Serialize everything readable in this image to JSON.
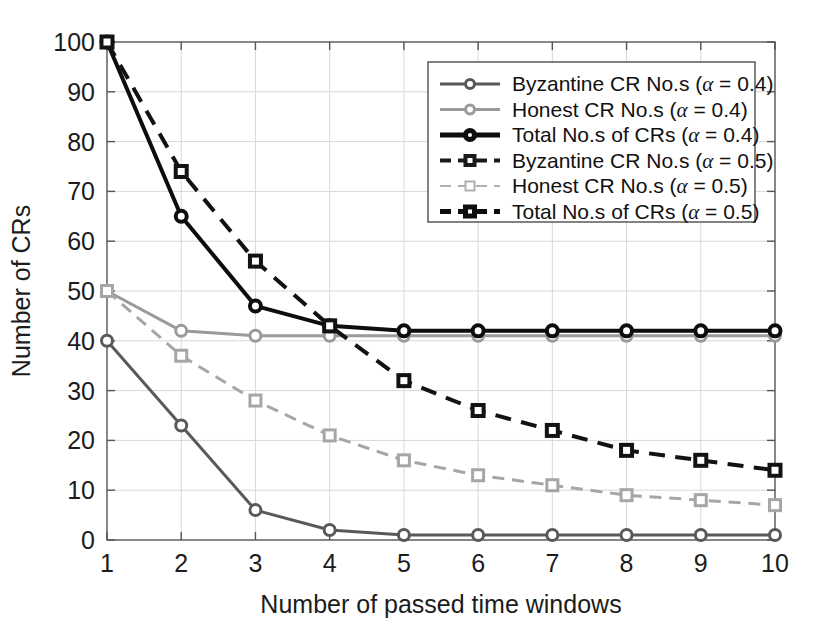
{
  "chart_data": {
    "type": "line",
    "title": "",
    "xlabel": "Number of passed time windows",
    "ylabel": "Number of CRs",
    "x": [
      1,
      2,
      3,
      4,
      5,
      6,
      7,
      8,
      9,
      10
    ],
    "xtick_labels": [
      "1",
      "2",
      "3",
      "4",
      "5",
      "6",
      "7",
      "8",
      "9",
      "10"
    ],
    "ytick_labels": [
      "0",
      "10",
      "20",
      "30",
      "40",
      "50",
      "60",
      "70",
      "80",
      "90",
      "100"
    ],
    "yticks": [
      0,
      10,
      20,
      30,
      40,
      50,
      60,
      70,
      80,
      90,
      100
    ],
    "xlim": [
      1,
      10
    ],
    "ylim": [
      0,
      100
    ],
    "grid": true,
    "legend_position": "upper right",
    "series": [
      {
        "name": "Byzantine CR No.s (α = 0.4)",
        "label_text": "Byzantine CR No.s (",
        "alpha_value": " = 0.4)",
        "values": [
          40,
          23,
          6,
          2,
          1,
          1,
          1,
          1,
          1,
          1
        ],
        "color": "#595959",
        "style": "solid",
        "width": 3,
        "marker": "circle"
      },
      {
        "name": "Honest CR No.s (α = 0.4)",
        "label_text": "Honest CR No.s (",
        "alpha_value": " = 0.4)",
        "values": [
          50,
          42,
          41,
          41,
          41,
          41,
          41,
          41,
          41,
          41
        ],
        "color": "#9a9a9a",
        "style": "solid",
        "width": 3,
        "marker": "circle"
      },
      {
        "name": "Total No.s of CRs (α = 0.4)",
        "label_text": "Total No.s of CRs (",
        "alpha_value": " = 0.4)",
        "values": [
          100,
          65,
          47,
          43,
          42,
          42,
          42,
          42,
          42,
          42
        ],
        "color": "#0d0d0d",
        "style": "solid",
        "width": 4,
        "marker": "circle"
      },
      {
        "name": "Byzantine CR No.s (α = 0.5)",
        "label_text": "Byzantine CR No.s (",
        "alpha_value": " = 0.5)",
        "values": [
          50,
          37,
          28,
          21,
          16,
          13,
          11,
          9,
          8,
          7
        ],
        "color": "#a6a6a6",
        "style": "dashed",
        "width": 3,
        "marker": "square"
      },
      {
        "name": "Honest CR No.s (α = 0.5)",
        "label_text": "Honest CR No.s (",
        "alpha_value": " = 0.5)",
        "values": [
          50,
          37,
          28,
          21,
          16,
          13,
          11,
          9,
          8,
          7
        ],
        "color": "#b8b8b8",
        "style": "dashed",
        "width": 2,
        "marker": "square",
        "hidden_duplicate": true
      },
      {
        "name": "Total No.s of CRs (α = 0.5)",
        "label_text": "Total No.s of CRs (",
        "alpha_value": " = 0.5)",
        "values": [
          100,
          74,
          56,
          43,
          32,
          26,
          22,
          18,
          16,
          14
        ],
        "color": "#121212",
        "style": "dashed",
        "width": 4,
        "marker": "square"
      }
    ],
    "legend_entries": [
      {
        "text": "Byzantine CR No.s (",
        "alpha": "α",
        "tail": " = 0.4)",
        "color": "#595959",
        "style": "solid",
        "width": 3,
        "marker": "circle"
      },
      {
        "text": "Honest CR No.s (",
        "alpha": "α",
        "tail": " = 0.4)",
        "color": "#9a9a9a",
        "style": "solid",
        "width": 3,
        "marker": "circle"
      },
      {
        "text": "Total No.s of CRs (",
        "alpha": "α",
        "tail": " = 0.4)",
        "color": "#0d0d0d",
        "style": "solid",
        "width": 5,
        "marker": "circle"
      },
      {
        "text": "Byzantine CR No.s (",
        "alpha": "α",
        "tail": " = 0.5)",
        "color": "#1a1a1a",
        "style": "dashed",
        "width": 4,
        "marker": "square"
      },
      {
        "text": "Honest CR No.s (",
        "alpha": "α",
        "tail": " = 0.5)",
        "color": "#b0b0b0",
        "style": "dashed",
        "width": 2,
        "marker": "square"
      },
      {
        "text": "Total No.s of CRs (",
        "alpha": "α",
        "tail": " = 0.5)",
        "color": "#0d0d0d",
        "style": "dashed",
        "width": 5,
        "marker": "square"
      }
    ],
    "colors": {
      "axis": "#555555",
      "grid": "#d8d8d8",
      "background": "#ffffff",
      "text": "#1c1c1c"
    }
  }
}
